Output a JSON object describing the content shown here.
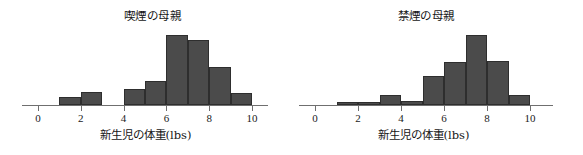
{
  "figure": {
    "background_color": "#ffffff",
    "bar_fill_color": "#4b4b4b",
    "bar_edge_color": "#2e2e2e",
    "axis_color": "#6f6f6f"
  },
  "chart_data": [
    {
      "type": "bar",
      "title": "喫煙の母親",
      "xlabel": "新生児の体重(lbs)",
      "ylabel": "",
      "grid": false,
      "legend": "none",
      "xlim": [
        0,
        11
      ],
      "ylim": [
        0,
        72
      ],
      "xticks": [
        0,
        2,
        4,
        6,
        8,
        10
      ],
      "xtick_labels": [
        "0",
        "2",
        "4",
        "6",
        "8",
        "10"
      ],
      "bin_edges": [
        1,
        2,
        3,
        4,
        5,
        6,
        7,
        8,
        9,
        10
      ],
      "categories": [
        "1-2",
        "2-3",
        "3-4",
        "4-5",
        "5-6",
        "6-7",
        "7-8",
        "8-9",
        "9-10"
      ],
      "values": [
        8,
        13,
        0,
        16,
        24,
        71,
        66,
        39,
        12
      ]
    },
    {
      "type": "bar",
      "title": "禁煙の母親",
      "xlabel": "新生児の体重(lbs)",
      "ylabel": "",
      "grid": false,
      "legend": "none",
      "xlim": [
        0,
        11
      ],
      "ylim": [
        0,
        72
      ],
      "xticks": [
        0,
        2,
        4,
        6,
        8,
        10
      ],
      "xtick_labels": [
        "0",
        "2",
        "4",
        "6",
        "8",
        "10"
      ],
      "bin_edges": [
        1,
        2,
        3,
        4,
        5,
        6,
        7,
        8,
        9,
        10
      ],
      "categories": [
        "1-2",
        "2-3",
        "3-4",
        "4-5",
        "5-6",
        "6-7",
        "7-8",
        "8-9",
        "9-10"
      ],
      "values": [
        3,
        3,
        10,
        4,
        29,
        44,
        71,
        45,
        10
      ]
    }
  ],
  "panels": [
    {
      "name": "smoking-mothers",
      "title": "喫煙の母親",
      "xlabel": "新生児の体重(lbs)"
    },
    {
      "name": "nonsmoking-mothers",
      "title": "禁煙の母親",
      "xlabel": "新生児の体重(lbs)"
    }
  ]
}
